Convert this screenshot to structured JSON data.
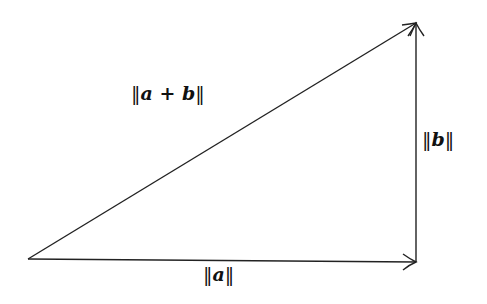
{
  "diagram": {
    "type": "vector-addition-triangle",
    "colors": {
      "stroke": "#222222",
      "background": "#ffffff"
    },
    "vertices": {
      "origin": [
        28,
        259
      ],
      "corner": [
        416,
        262
      ],
      "tip": [
        416,
        22
      ]
    },
    "vectors": [
      {
        "id": "a",
        "from": "origin",
        "to": "corner",
        "label": "||a||"
      },
      {
        "id": "b",
        "from": "corner",
        "to": "tip",
        "label": "||b||"
      },
      {
        "id": "a_plus_b",
        "from": "origin",
        "to": "tip",
        "label": "||a + b||"
      }
    ],
    "labels": {
      "a": {
        "bars_left": "‖",
        "text": "a",
        "bars_right": "‖"
      },
      "b": {
        "bars_left": "‖",
        "text": "b",
        "bars_right": "‖"
      },
      "sum": {
        "bars_left": "‖",
        "text": "a + b",
        "bars_right": "‖"
      }
    }
  }
}
